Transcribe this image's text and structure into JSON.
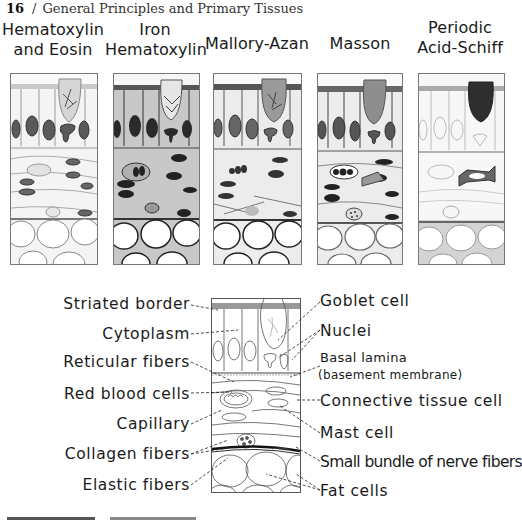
{
  "running_head": {
    "page_number": "16",
    "separator": "/",
    "title": "General Principles and Primary Tissues"
  },
  "stains": [
    {
      "line1": "Hematoxylin",
      "line2": "and Eosin",
      "tone": "light",
      "goblet": "pale"
    },
    {
      "line1": "Iron",
      "line2": "Hematoxylin",
      "tone": "gray",
      "goblet": "pale"
    },
    {
      "line1": "",
      "line2": "Mallory-Azan",
      "tone": "medium",
      "goblet": "medium"
    },
    {
      "line1": "",
      "line2": "Masson",
      "tone": "medium",
      "goblet": "medium"
    },
    {
      "line1": "Periodic",
      "line2": "Acid-Schiff",
      "tone": "light",
      "goblet": "dark"
    }
  ],
  "diagram": {
    "left_labels": [
      "Striated border",
      "Cytoplasm",
      "Reticular fibers",
      "Red blood cells",
      "Capillary",
      "Collagen fibers",
      "Elastic fibers"
    ],
    "right_labels": [
      "Goblet cell",
      "Nuclei",
      "Basal lamina",
      "(basement membrane)",
      "Connective tissue cell",
      "Mast cell",
      "Small bundle of nerve fibers",
      "Fat cells"
    ]
  },
  "colors": {
    "ink": "#1a1a1a",
    "panel_border": "#777777",
    "nucleus_dark": "#3a3a3a",
    "pas_goblet": "#2e2e2e"
  }
}
